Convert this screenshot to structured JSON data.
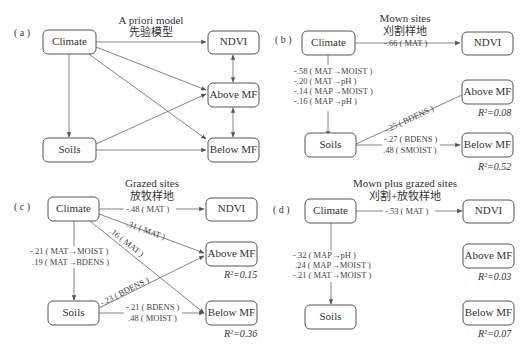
{
  "panels": [
    {
      "id": "a",
      "label": "( a )",
      "title_en": "A priori model",
      "title_zh": "先验模型",
      "nodes": {
        "climate": "Climate",
        "soils": "Soils",
        "ndvi": "NDVI",
        "above": "Above MF",
        "below": "Below MF"
      }
    },
    {
      "id": "b",
      "label": "( b )",
      "title_en": "Mown sites",
      "title_zh": "刈割样地",
      "nodes": {
        "climate": "Climate",
        "soils": "Soils",
        "ndvi": "NDVI",
        "above": "Above MF",
        "below": "Below MF"
      },
      "coef_climate_ndvi": "-.66 ( MAT )",
      "coef_climate_soils": [
        "-.58 ( MAT→MOIST )",
        "-.20 ( MAT→pH )",
        "-.14 ( MAP→MOIST )",
        "-.16 ( MAP→pH )"
      ],
      "coef_soils_above": "-.25 ( BDENS )",
      "coef_soils_below": [
        "-.27 ( BDENS )",
        ".48 ( SMOIST )"
      ],
      "r2_above": "R²=0.08",
      "r2_below": "R²=0.52"
    },
    {
      "id": "c",
      "label": "( c )",
      "title_en": "Grazed sites",
      "title_zh": "放牧样地",
      "nodes": {
        "climate": "Climate",
        "soils": "Soils",
        "ndvi": "NDVI",
        "above": "Above MF",
        "below": "Below MF"
      },
      "coef_climate_ndvi": "-.48 ( MAT )",
      "coef_climate_above": ".31 ( MAT )",
      "coef_climate_below": ".16 ( MAT )",
      "coef_climate_soils": [
        "-.21 ( MAT→MOIST )",
        ".19 ( MAT→BDENS )"
      ],
      "coef_soils_above": "-.23 ( BDENS )",
      "coef_soils_below": [
        "-.21 ( BDENS )",
        ".48 ( MOIST )"
      ],
      "r2_above": "R²=0.15",
      "r2_below": "R²=0.36"
    },
    {
      "id": "d",
      "label": "( d )",
      "title_en": "Mown plus grazed sites",
      "title_zh": "刈割+放牧样地",
      "nodes": {
        "climate": "Climate",
        "soils": "Soils",
        "ndvi": "NDVI",
        "above": "Above MF",
        "below": "Below MF"
      },
      "coef_climate_ndvi": "-.53 ( MAT )",
      "coef_climate_soils": [
        "-.32 ( MAP→pH )",
        ".24 ( MAP→MOIST )",
        "-.21 ( MAT→MOIST )"
      ],
      "r2_above": "R²=0.03",
      "r2_below": "R²=0.07"
    }
  ]
}
